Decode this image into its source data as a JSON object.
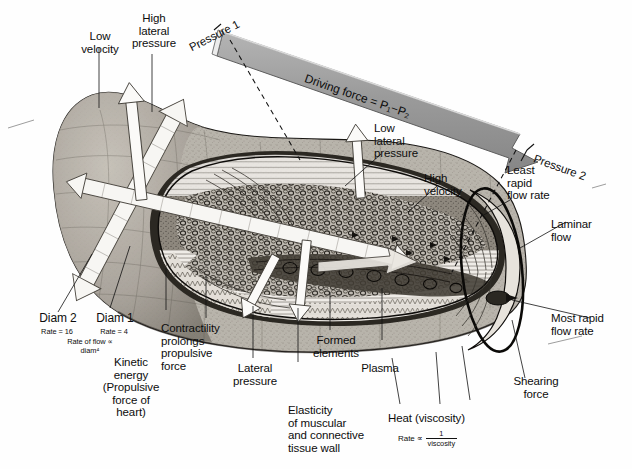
{
  "figure": {
    "background_color": "#fefefe",
    "ink_color": "#111111",
    "arrow_fill": "#9a9a9a",
    "arrow_edge": "#4a4a4a",
    "tissue_tone": "#b9b4ac",
    "lumen_tone": "#e9e6e0"
  },
  "labels": {
    "low_velocity": "Low\nvelocity",
    "high_lateral_pressure": "High\nlateral\npressure",
    "pressure_1": "Pressure 1",
    "driving_force": "Driving force = P₁−P₂",
    "pressure_2": "Pressure 2",
    "low_lateral_pressure": "Low\nlateral\npressure",
    "high_velocity": "High\nvelocity",
    "least_rapid_flow_rate": "Least\nrapid\nflow rate",
    "laminar_flow": "Laminar\nflow",
    "most_rapid_flow_rate": "Most rapid\nflow rate",
    "shearing_force": "Shearing\nforce",
    "diam_2": "Diam 2",
    "diam_2_rate": "Rate = 16",
    "diam_1": "Diam 1",
    "diam_1_rate": "Rate = 4",
    "rate_of_flow_law": "Rate of flow  ∝",
    "rate_of_flow_law_term": "diam⁴",
    "kinetic_energy": "Kinetic\nenergy\n(Propulsive\nforce of\nheart)",
    "contractility": "Contractility\nprolongs\npropulsive\nforce",
    "lateral_pressure": "Lateral\npressure",
    "elasticity": "Elasticity\nof muscular\nand connective\ntissue wall",
    "formed_elements": "Formed\nelements",
    "plasma": "Plasma",
    "heat_viscosity": "Heat (viscosity)",
    "heat_rate_prefix": "Rate  ∝",
    "heat_rate_numerator": "1",
    "heat_rate_denominator": "viscosity"
  }
}
